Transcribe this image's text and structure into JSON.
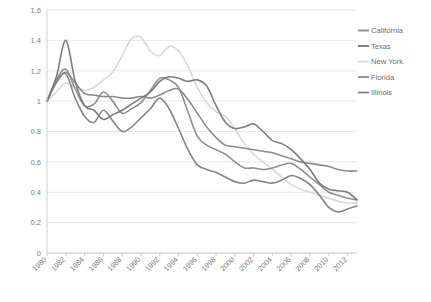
{
  "chart_data": {
    "type": "line",
    "title": "",
    "subtitle": "",
    "xlabel": "",
    "ylabel": "",
    "grid": true,
    "legend_position": "right",
    "ylim": [
      0,
      1.6
    ],
    "yticks": [
      "0",
      "0.2",
      "0.4",
      "0.6",
      "0.8",
      "1",
      "1.2",
      "1.4",
      "1.6"
    ],
    "ytick_values": [
      0,
      0.2,
      0.4,
      0.6,
      0.8,
      1.0,
      1.2,
      1.4,
      1.6
    ],
    "xlim": [
      1980,
      2013
    ],
    "xticks": [
      "1980",
      "1982",
      "1984",
      "1986",
      "1988",
      "1990",
      "1992",
      "1994",
      "1996",
      "1998",
      "2000",
      "2002",
      "2004",
      "2006",
      "2008",
      "2010",
      "2012"
    ],
    "xtick_values": [
      1980,
      1982,
      1984,
      1986,
      1988,
      1990,
      1992,
      1994,
      1996,
      1998,
      2000,
      2002,
      2004,
      2006,
      2008,
      2010,
      2012
    ],
    "x": [
      1980,
      1981,
      1982,
      1983,
      1984,
      1985,
      1986,
      1987,
      1988,
      1989,
      1990,
      1991,
      1992,
      1993,
      1994,
      1995,
      1996,
      1997,
      1998,
      1999,
      2000,
      2001,
      2002,
      2003,
      2004,
      2005,
      2006,
      2007,
      2008,
      2009,
      2010,
      2011,
      2012,
      2013
    ],
    "series": [
      {
        "name": "California",
        "color": "#8c8c8c",
        "values": [
          1.0,
          1.13,
          1.19,
          1.12,
          1.05,
          1.04,
          1.03,
          1.03,
          1.02,
          1.02,
          1.03,
          1.02,
          1.04,
          1.07,
          1.08,
          1.01,
          0.92,
          0.83,
          0.76,
          0.71,
          0.7,
          0.69,
          0.68,
          0.67,
          0.66,
          0.64,
          0.62,
          0.6,
          0.59,
          0.58,
          0.57,
          0.55,
          0.54,
          0.54
        ]
      },
      {
        "name": "Texas",
        "color": "#7d7d7d",
        "values": [
          1.0,
          1.16,
          1.4,
          1.13,
          0.97,
          0.94,
          0.88,
          0.91,
          0.94,
          0.98,
          1.02,
          1.06,
          1.13,
          1.16,
          1.15,
          1.13,
          1.14,
          1.1,
          0.97,
          0.86,
          0.82,
          0.83,
          0.85,
          0.8,
          0.74,
          0.72,
          0.68,
          0.62,
          0.55,
          0.46,
          0.42,
          0.41,
          0.4,
          0.35
        ]
      },
      {
        "name": "New York",
        "color": "#d9d9d9",
        "values": [
          1.0,
          1.06,
          1.12,
          1.09,
          1.07,
          1.09,
          1.14,
          1.19,
          1.3,
          1.41,
          1.42,
          1.33,
          1.3,
          1.36,
          1.33,
          1.23,
          1.09,
          0.99,
          0.93,
          0.9,
          0.82,
          0.72,
          0.65,
          0.6,
          0.55,
          0.5,
          0.45,
          0.42,
          0.4,
          0.38,
          0.36,
          0.34,
          0.33,
          0.33
        ]
      },
      {
        "name": "Florida",
        "color": "#909090",
        "values": [
          1.0,
          1.14,
          1.21,
          1.08,
          0.97,
          0.98,
          1.06,
          1.0,
          0.92,
          0.95,
          0.99,
          1.07,
          1.15,
          1.14,
          1.09,
          0.93,
          0.77,
          0.71,
          0.68,
          0.65,
          0.6,
          0.56,
          0.56,
          0.55,
          0.56,
          0.58,
          0.59,
          0.55,
          0.5,
          0.45,
          0.4,
          0.38,
          0.36,
          0.35
        ]
      },
      {
        "name": "Illinois",
        "color": "#868686",
        "values": [
          1.0,
          1.12,
          1.18,
          1.02,
          0.9,
          0.86,
          0.94,
          0.87,
          0.8,
          0.83,
          0.89,
          0.95,
          1.02,
          0.95,
          0.82,
          0.68,
          0.58,
          0.55,
          0.53,
          0.5,
          0.47,
          0.46,
          0.48,
          0.47,
          0.46,
          0.48,
          0.51,
          0.49,
          0.45,
          0.38,
          0.3,
          0.27,
          0.29,
          0.31
        ]
      }
    ],
    "legend": [
      {
        "label": "California",
        "color": "#8c8c8c",
        "show_swatch": true
      },
      {
        "label": "Texas",
        "color": "#7d7d7d",
        "show_swatch": true
      },
      {
        "label": "New York",
        "color": "#d9d9d9",
        "show_swatch": true
      },
      {
        "label": "Florida",
        "color": "#909090",
        "show_swatch": true
      },
      {
        "label": "Illinois",
        "color": "#868686",
        "show_swatch": true
      }
    ]
  },
  "plot": {
    "background": "#ffffff",
    "gridline_color": "#e2e2e2",
    "axis_color": "#cccccc"
  }
}
